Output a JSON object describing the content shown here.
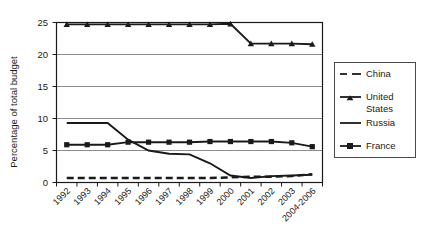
{
  "chart_data": {
    "type": "line",
    "title": "",
    "subtitle": "",
    "xlabel": "",
    "ylabel": "Percentage of total budget",
    "categories": [
      "1992",
      "1993",
      "1994",
      "1995",
      "1996",
      "1997",
      "1998",
      "1999",
      "2000",
      "2001",
      "2002",
      "2003",
      "2004-2006"
    ],
    "ylim": [
      0,
      25
    ],
    "yticks": [
      0,
      5,
      10,
      15,
      20,
      25
    ],
    "ytick_labels": [
      "0",
      "5",
      "10",
      "15",
      "20",
      "25"
    ],
    "grid": "horizontal",
    "legend_position": "right",
    "series": [
      {
        "name": "China",
        "marker": "none",
        "dash": "dashed",
        "values": [
          0.7,
          0.7,
          0.7,
          0.7,
          0.7,
          0.7,
          0.7,
          0.7,
          0.8,
          0.9,
          0.9,
          1.0,
          1.3
        ]
      },
      {
        "name": "United States",
        "marker": "triangle",
        "dash": "solid",
        "values": [
          24.7,
          24.7,
          24.7,
          24.7,
          24.7,
          24.7,
          24.7,
          24.7,
          24.8,
          21.7,
          21.7,
          21.7,
          21.6
        ]
      },
      {
        "name": "Russia",
        "marker": "none",
        "dash": "solid",
        "values": [
          9.3,
          9.3,
          9.3,
          6.7,
          5.0,
          4.5,
          4.4,
          3.0,
          1.1,
          0.7,
          1.0,
          1.1,
          1.2
        ]
      },
      {
        "name": "France",
        "marker": "square",
        "dash": "solid",
        "values": [
          5.9,
          5.9,
          5.9,
          6.3,
          6.3,
          6.3,
          6.3,
          6.4,
          6.4,
          6.4,
          6.4,
          6.2,
          5.6
        ]
      }
    ]
  },
  "legend": {
    "entries": [
      {
        "label": "China"
      },
      {
        "label": "United"
      },
      {
        "label": "States"
      },
      {
        "label": "Russia"
      },
      {
        "label": "France"
      }
    ]
  },
  "colors": {
    "ink": "#1a1a1a",
    "grid": "#8c8c8c",
    "background": "#ffffff"
  }
}
